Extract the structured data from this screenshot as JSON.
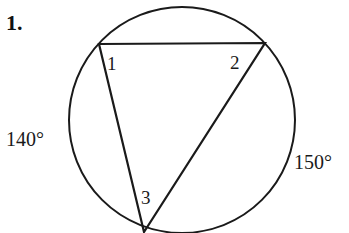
{
  "problem": {
    "number_label": "1."
  },
  "figure": {
    "stroke_color": "#1a1a1a",
    "background_color": "#ffffff",
    "circle": {
      "cx": 182,
      "cy": 120,
      "r": 113
    },
    "triangle": {
      "vertices": [
        {
          "id": "1",
          "x": 99,
          "y": 44
        },
        {
          "id": "2",
          "x": 265,
          "y": 43
        },
        {
          "id": "3",
          "x": 144,
          "y": 232
        }
      ]
    },
    "angle_labels": [
      {
        "text": "1",
        "x": 107,
        "y": 70
      },
      {
        "text": "2",
        "x": 230,
        "y": 69
      },
      {
        "text": "3",
        "x": 141,
        "y": 204
      }
    ],
    "arc_labels": [
      {
        "name": "left-arc",
        "text": "140°",
        "x": 6,
        "y": 146
      },
      {
        "name": "right-arc",
        "text": "150°",
        "x": 294,
        "y": 169
      }
    ]
  }
}
